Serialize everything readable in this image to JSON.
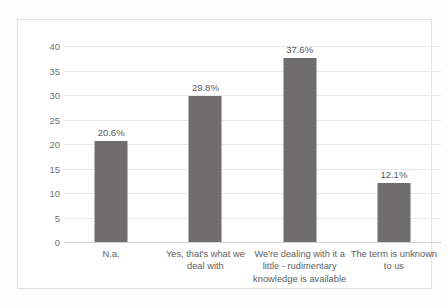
{
  "chart_data": {
    "type": "bar",
    "title": "",
    "subtitle": "",
    "xlabel": "",
    "ylabel": "",
    "ylim": [
      0,
      40
    ],
    "ytick_step": 5,
    "yticks": [
      "0",
      "5",
      "10",
      "15",
      "20",
      "25",
      "30",
      "35",
      "40"
    ],
    "grid": true,
    "legend": false,
    "legend_position": "none",
    "categories": [
      "N.a.",
      "Yes, that's what we deal with",
      "We're dealing with it a little - rudimentary knowledge is available",
      "The term is unknown to us"
    ],
    "values": [
      20.6,
      29.8,
      37.6,
      12.1
    ],
    "data_labels": [
      "20.6%",
      "29.8%",
      "37.6%",
      "12.1%"
    ],
    "series": [
      {
        "name": "",
        "values": [
          20.6,
          29.8,
          37.6,
          12.1
        ]
      }
    ],
    "colors": {
      "bar": "#6f6d6d",
      "gridline": "#e9e9e9",
      "axis": "#d4d4d4",
      "tick_text": "#6f6f6f",
      "label_text": "#595959",
      "category_text": "#5e5e5e",
      "plot_background": "#ffffff",
      "chart_border": "#e2e2e2"
    }
  }
}
